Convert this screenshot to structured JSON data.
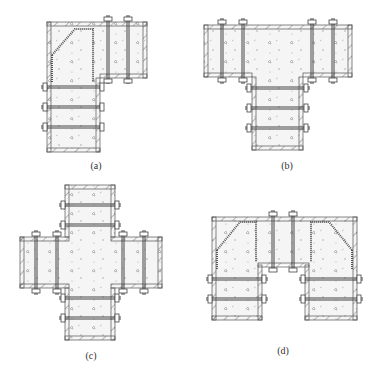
{
  "figure": {
    "panels": [
      {
        "id": "a",
        "label": "(a)",
        "shape": "L-junction formwork",
        "label_x": 96,
        "label_y": 160
      },
      {
        "id": "b",
        "label": "(b)",
        "shape": "T-junction formwork",
        "label_x": 287,
        "label_y": 160
      },
      {
        "id": "c",
        "label": "(c)",
        "shape": "cross-junction formwork",
        "label_x": 91,
        "label_y": 350
      },
      {
        "id": "d",
        "label": "(d)",
        "shape": "double-T junction formwork",
        "label_x": 283,
        "label_y": 345
      }
    ],
    "colors": {
      "line": "#555555",
      "hatch": "#777777",
      "fill": "#f4f4f4",
      "bolt": "#444444"
    }
  }
}
